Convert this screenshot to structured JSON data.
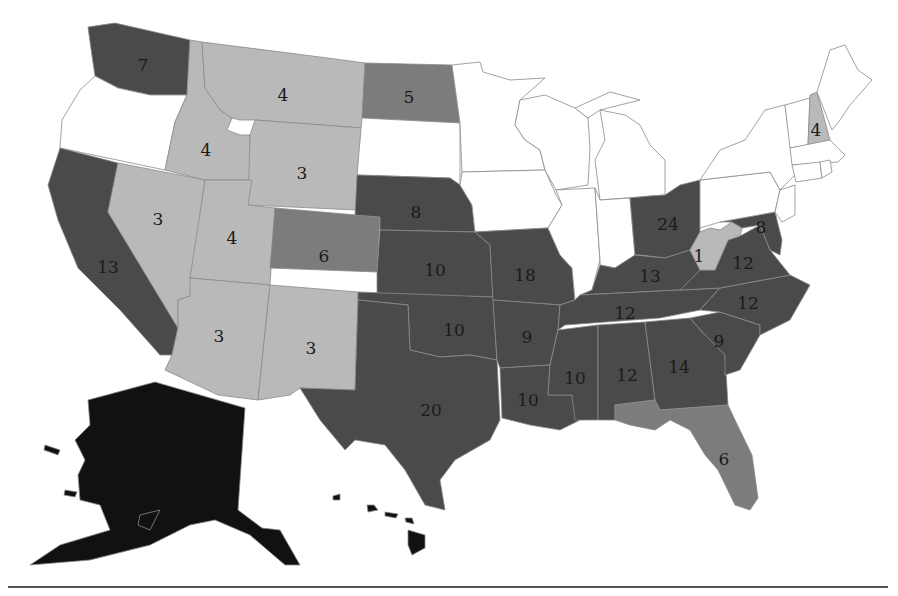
{
  "colors": {
    "white": "#ffffff",
    "light": "#b9b9b9",
    "medium": "#7c7c7c",
    "dark": "#4a4a4a",
    "black": "#111111"
  },
  "states": [
    {
      "id": "WA",
      "label": "7",
      "shade": "dark",
      "lx": 143,
      "ly": 65
    },
    {
      "id": "OR",
      "label": "",
      "shade": "white",
      "lx": 110,
      "ly": 120
    },
    {
      "id": "CA",
      "label": "13",
      "shade": "dark",
      "lx": 108,
      "ly": 267
    },
    {
      "id": "NV",
      "label": "3",
      "shade": "light",
      "lx": 158,
      "ly": 219
    },
    {
      "id": "ID",
      "label": "4",
      "shade": "light",
      "lx": 206,
      "ly": 150
    },
    {
      "id": "MT",
      "label": "4",
      "shade": "light",
      "lx": 283,
      "ly": 95
    },
    {
      "id": "WY",
      "label": "3",
      "shade": "light",
      "lx": 302,
      "ly": 173
    },
    {
      "id": "UT",
      "label": "4",
      "shade": "light",
      "lx": 232,
      "ly": 238
    },
    {
      "id": "CO",
      "label": "6",
      "shade": "medium",
      "lx": 324,
      "ly": 256
    },
    {
      "id": "AZ",
      "label": "3",
      "shade": "light",
      "lx": 219,
      "ly": 336
    },
    {
      "id": "NM",
      "label": "3",
      "shade": "light",
      "lx": 311,
      "ly": 348
    },
    {
      "id": "ND",
      "label": "5",
      "shade": "medium",
      "lx": 409,
      "ly": 97
    },
    {
      "id": "SD",
      "label": "",
      "shade": "white",
      "lx": 411,
      "ly": 152
    },
    {
      "id": "NE",
      "label": "8",
      "shade": "dark",
      "lx": 416,
      "ly": 212
    },
    {
      "id": "KS",
      "label": "10",
      "shade": "dark",
      "lx": 435,
      "ly": 270
    },
    {
      "id": "OK",
      "label": "10",
      "shade": "dark",
      "lx": 454,
      "ly": 330
    },
    {
      "id": "TX",
      "label": "20",
      "shade": "dark",
      "lx": 431,
      "ly": 410
    },
    {
      "id": "MN",
      "label": "",
      "shade": "white",
      "lx": 480,
      "ly": 110
    },
    {
      "id": "IA",
      "label": "",
      "shade": "white",
      "lx": 510,
      "ly": 185
    },
    {
      "id": "MO",
      "label": "18",
      "shade": "dark",
      "lx": 525,
      "ly": 275
    },
    {
      "id": "AR",
      "label": "9",
      "shade": "dark",
      "lx": 527,
      "ly": 337
    },
    {
      "id": "LA",
      "label": "10",
      "shade": "dark",
      "lx": 528,
      "ly": 400
    },
    {
      "id": "WI",
      "label": "",
      "shade": "white",
      "lx": 560,
      "ly": 140
    },
    {
      "id": "IL",
      "label": "",
      "shade": "white",
      "lx": 580,
      "ly": 220
    },
    {
      "id": "MI",
      "label": "",
      "shade": "white",
      "lx": 640,
      "ly": 140
    },
    {
      "id": "IN",
      "label": "",
      "shade": "white",
      "lx": 620,
      "ly": 220
    },
    {
      "id": "OH",
      "label": "24",
      "shade": "dark",
      "lx": 668,
      "ly": 224
    },
    {
      "id": "KY",
      "label": "13",
      "shade": "dark",
      "lx": 650,
      "ly": 276
    },
    {
      "id": "TN",
      "label": "12",
      "shade": "dark",
      "lx": 625,
      "ly": 313
    },
    {
      "id": "MS",
      "label": "10",
      "shade": "dark",
      "lx": 575,
      "ly": 378
    },
    {
      "id": "AL",
      "label": "12",
      "shade": "dark",
      "lx": 627,
      "ly": 375
    },
    {
      "id": "GA",
      "label": "14",
      "shade": "dark",
      "lx": 679,
      "ly": 367
    },
    {
      "id": "FL",
      "label": "6",
      "shade": "medium",
      "lx": 724,
      "ly": 459
    },
    {
      "id": "SC",
      "label": "9",
      "shade": "dark",
      "lx": 719,
      "ly": 341
    },
    {
      "id": "NC",
      "label": "12",
      "shade": "dark",
      "lx": 748,
      "ly": 303
    },
    {
      "id": "VA",
      "label": "12",
      "shade": "dark",
      "lx": 743,
      "ly": 263
    },
    {
      "id": "WV",
      "label": "1",
      "shade": "light",
      "lx": 699,
      "ly": 256
    },
    {
      "id": "MD",
      "label": "8",
      "shade": "dark",
      "lx": 761,
      "ly": 227
    },
    {
      "id": "PA",
      "label": "",
      "shade": "white",
      "lx": 740,
      "ly": 190
    },
    {
      "id": "NY",
      "label": "",
      "shade": "white",
      "lx": 770,
      "ly": 140
    },
    {
      "id": "NH",
      "label": "4",
      "shade": "light",
      "lx": 816,
      "ly": 130
    },
    {
      "id": "ME",
      "label": "",
      "shade": "white",
      "lx": 840,
      "ly": 90
    },
    {
      "id": "AK",
      "label": "",
      "shade": "black",
      "lx": 170,
      "ly": 470
    },
    {
      "id": "HI",
      "label": "",
      "shade": "black",
      "lx": 420,
      "ly": 530
    }
  ]
}
